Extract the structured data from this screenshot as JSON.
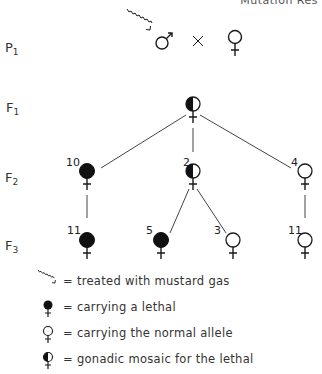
{
  "header": {
    "cut_off_text": "Mutation Res"
  },
  "generations": [
    {
      "label": "P",
      "sub": "1"
    },
    {
      "label": "F",
      "sub": "1"
    },
    {
      "label": "F",
      "sub": "2"
    },
    {
      "label": "F",
      "sub": "3"
    }
  ],
  "cross": {
    "male_symbol": "♂",
    "cross_symbol": "×",
    "female_symbol": "♀",
    "male_treated": true
  },
  "f1": {
    "type": "mosaic"
  },
  "f2": [
    {
      "count": "10",
      "type": "lethal"
    },
    {
      "count": "2",
      "type": "mosaic"
    },
    {
      "count": "4",
      "type": "normal"
    }
  ],
  "f3": [
    {
      "count": "11",
      "type": "lethal",
      "parent": 0
    },
    {
      "count": "5",
      "type": "lethal",
      "parent": 1
    },
    {
      "count": "3",
      "type": "normal",
      "parent": 1
    },
    {
      "count": "11",
      "type": "normal",
      "parent": 2
    }
  ],
  "legend": [
    {
      "icon": "wavy-arrow-icon",
      "text": "= treated with mustard gas"
    },
    {
      "icon": "filled-female-icon",
      "text": "= carrying a lethal"
    },
    {
      "icon": "open-female-icon",
      "text": "= carrying the normal allele"
    },
    {
      "icon": "half-filled-female-icon",
      "text": "= gonadic mosaic for the lethal"
    }
  ]
}
